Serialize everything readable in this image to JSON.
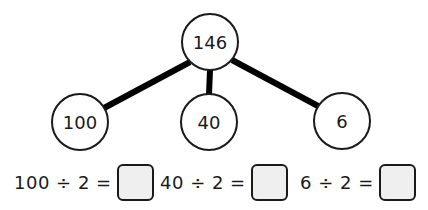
{
  "tree": {
    "root": {
      "label": "146",
      "cx": 210,
      "cy": 42
    },
    "children": [
      {
        "label": "100",
        "cx": 80,
        "cy": 122
      },
      {
        "label": "40",
        "cx": 209,
        "cy": 122
      },
      {
        "label": "6",
        "cx": 342,
        "cy": 121
      }
    ],
    "node_radius": 28,
    "line_color": "#000000"
  },
  "equations": [
    {
      "text": "100 ÷ 2 =",
      "answer": ""
    },
    {
      "text": "40 ÷ 2 =",
      "answer": ""
    },
    {
      "text": "6 ÷ 2 =",
      "answer": ""
    }
  ],
  "colors": {
    "ink": "#1a1a1a",
    "answer_box_fill": "#efefef"
  }
}
